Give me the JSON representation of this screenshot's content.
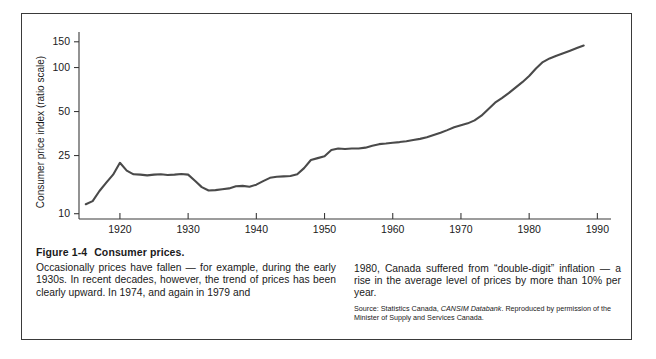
{
  "figure": {
    "number": "Figure 1-4",
    "title": "Consumer prices.",
    "caption_left": "Occasionally prices have fallen — for example, during the early 1930s. In recent decades, however, the trend of prices has been clearly upward. In 1974, and again in 1979 and",
    "caption_right": "1980, Canada suffered from “double-digit” inflation — a rise in the average level of prices by more than 10% per year.",
    "source_line_1": "Source: Statistics Canada, ",
    "source_italic": "CANSIM Databank",
    "source_line_2": ". Reproduced by permission of the Minister of Supply and Services Canada.",
    "border_color": "#3a3a3a",
    "line_color": "#4a4a4a"
  },
  "chart_data": {
    "type": "line",
    "title": "",
    "xlabel": "",
    "ylabel": "Consumer price index (ratio scale)",
    "yscale": "log",
    "ylim": [
      9.2,
      175
    ],
    "xlim": [
      1914,
      1992
    ],
    "grid": false,
    "legend": "none",
    "ytick_values": [
      10,
      25,
      50,
      100,
      150
    ],
    "ytick_labels": [
      "10",
      "25",
      "50",
      "100",
      "150"
    ],
    "xtick_values": [
      1920,
      1930,
      1940,
      1950,
      1960,
      1970,
      1980,
      1990
    ],
    "xtick_labels": [
      "1920",
      "1930",
      "1940",
      "1950",
      "1960",
      "1970",
      "1980",
      "1990"
    ],
    "series": [
      {
        "name": "Consumer price index",
        "x": [
          1915,
          1916,
          1917,
          1918,
          1919,
          1920,
          1921,
          1922,
          1923,
          1924,
          1925,
          1926,
          1927,
          1928,
          1929,
          1930,
          1931,
          1932,
          1933,
          1934,
          1935,
          1936,
          1937,
          1938,
          1939,
          1940,
          1941,
          1942,
          1943,
          1944,
          1945,
          1946,
          1947,
          1948,
          1949,
          1950,
          1951,
          1952,
          1953,
          1954,
          1955,
          1956,
          1957,
          1958,
          1959,
          1960,
          1961,
          1962,
          1963,
          1964,
          1965,
          1966,
          1967,
          1968,
          1969,
          1970,
          1971,
          1972,
          1973,
          1974,
          1975,
          1976,
          1977,
          1978,
          1979,
          1980,
          1981,
          1982,
          1983,
          1984,
          1985,
          1986,
          1987,
          1988
        ],
        "y": [
          11.6,
          12.2,
          14.3,
          16.3,
          18.5,
          22.3,
          19.7,
          18.6,
          18.5,
          18.3,
          18.5,
          18.6,
          18.4,
          18.5,
          18.7,
          18.5,
          16.8,
          15.2,
          14.4,
          14.5,
          14.7,
          14.9,
          15.4,
          15.5,
          15.3,
          15.8,
          16.7,
          17.6,
          17.9,
          18.0,
          18.1,
          18.6,
          20.5,
          23.3,
          24.0,
          24.7,
          27.3,
          27.9,
          27.7,
          27.9,
          27.9,
          28.3,
          29.2,
          29.9,
          30.2,
          30.6,
          30.9,
          31.3,
          31.9,
          32.5,
          33.3,
          34.5,
          35.8,
          37.3,
          39.0,
          40.3,
          41.5,
          43.5,
          46.8,
          51.9,
          57.5,
          61.8,
          66.8,
          72.8,
          79.4,
          87.5,
          98.4,
          109.0,
          115.4,
          120.4,
          125.2,
          130.4,
          136.0,
          141.5
        ]
      }
    ]
  }
}
